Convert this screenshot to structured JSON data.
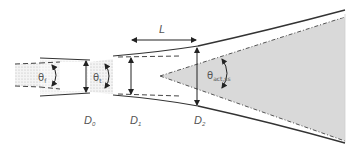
{
  "diagram": {
    "labels": {
      "L": "L",
      "D0": "D",
      "D0_sub": "0",
      "D1": "D",
      "D1_sub": "1",
      "D2": "D",
      "D2_sub": "2",
      "theta_f": "θ",
      "theta_f_sub": "f",
      "theta_t": "θ",
      "theta_t_sub": "t",
      "theta_act": "θ",
      "theta_act_sub": "act,ss"
    },
    "colors": {
      "line": "#333333",
      "dotted_fill": "#e6e6e6",
      "spray_fill": "#d9d9d9"
    }
  }
}
